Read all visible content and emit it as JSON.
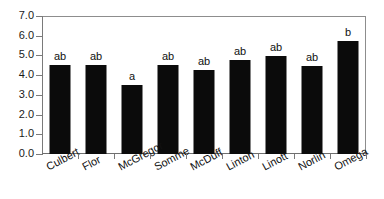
{
  "chart_data": {
    "type": "bar",
    "title": "",
    "subtitle": "",
    "xlabel": "",
    "ylabel": "",
    "ylim": [
      0.0,
      7.0
    ],
    "grid": false,
    "legend": "none",
    "bar_color": "#0b0b0b",
    "frame_color": "#8d8d8d",
    "y_ticks": [
      "0.0",
      "1.0",
      "2.0",
      "3.0",
      "4.0",
      "5.0",
      "6.0",
      "7.0"
    ],
    "y_tick_values": [
      0.0,
      1.0,
      2.0,
      3.0,
      4.0,
      5.0,
      6.0,
      7.0
    ],
    "categories": [
      "Culbert",
      "Flor",
      "McGregor",
      "Somme",
      "McDuff",
      "Linton",
      "Linott",
      "Norlin",
      "Omega"
    ],
    "values": [
      4.5,
      4.5,
      3.5,
      4.5,
      4.25,
      4.75,
      4.95,
      4.45,
      5.75
    ],
    "annotations": [
      "ab",
      "ab",
      "a",
      "ab",
      "ab",
      "ab",
      "ab",
      "ab",
      "b"
    ]
  }
}
